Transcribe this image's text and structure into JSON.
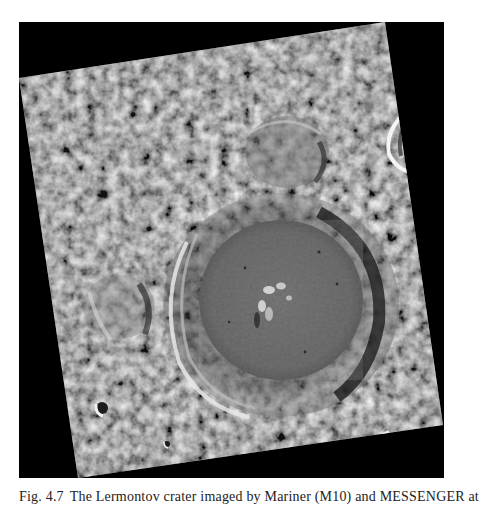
{
  "figure": {
    "background_color": "#000000",
    "surface_base_color": "#6e6e6e",
    "crater_floor_color": "#5c5c5c",
    "highlight_color": "#e6e6e6",
    "shadow_color": "#1e1e1e",
    "features": [
      {
        "name": "main-crater",
        "description": "Large crater with terraced rim and smooth floor, central peaks"
      },
      {
        "name": "central-peaks",
        "description": "Cluster of small bright peaks near crater center"
      },
      {
        "name": "left-crater",
        "description": "Degraded crater on left side"
      },
      {
        "name": "upper-crater",
        "description": "Degraded crater in upper middle"
      },
      {
        "name": "small-bright-crater-lower-left",
        "description": "Small fresh crater with bright rim"
      },
      {
        "name": "right-edge-crater",
        "description": "Fresh crater cut by right image edge"
      },
      {
        "name": "lower-right-crater",
        "description": "Fresh crater cut by bottom image edge"
      }
    ]
  },
  "caption": {
    "label": "Fig. 4.7",
    "text": "The Lermontov crater imaged by Mariner (M10) and MESSENGER at"
  }
}
